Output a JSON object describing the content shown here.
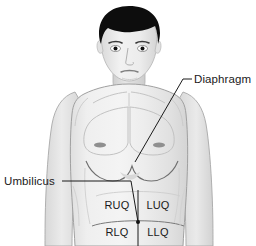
{
  "figure": {
    "background_color": "#ffffff"
  },
  "colors": {
    "skin_fill": "#ececec",
    "skin_shade": "#dcdcdc",
    "skin_shade_dark": "#cfcfcf",
    "outline": "#9a9a9a",
    "hair": "#101010",
    "label_text": "#1a1a1a",
    "leader_line": "#1a1a1a",
    "nipple": "#8c8c8c"
  },
  "labels": [
    {
      "id": "diaphragm",
      "text": "Diaphragm",
      "x": 194,
      "y": 83,
      "anchor": "start"
    },
    {
      "id": "umbilicus",
      "text": "Umbilicus",
      "x": 4,
      "y": 185,
      "anchor": "start"
    }
  ],
  "quadrants": [
    {
      "id": "ruq",
      "text": "RUQ",
      "x": 117,
      "y": 209,
      "full_name": "Right Upper Quadrant"
    },
    {
      "id": "luq",
      "text": "LUQ",
      "x": 152,
      "y": 209,
      "full_name": "Left Upper Quadrant"
    },
    {
      "id": "rlq",
      "text": "RLQ",
      "x": 117,
      "y": 236,
      "full_name": "Right Lower Quadrant"
    },
    {
      "id": "llq",
      "text": "LLQ",
      "x": 152,
      "y": 236,
      "full_name": "Left Lower Quadrant"
    }
  ],
  "leaders": {
    "diaphragm": {
      "label_dash": "M 183 79 L 192 79",
      "path": "M 183 79 L 135 162"
    },
    "umbilicus": {
      "path": "M 62 181 L 131 181 L 138 222"
    }
  },
  "quadrant_axes": {
    "vertical": "M 138 190 L 138 246",
    "umbilicus_point": {
      "x": 138,
      "y": 222
    }
  },
  "anatomy_parts": [
    {
      "id": "hair",
      "name": "hair"
    },
    {
      "id": "face",
      "name": "face"
    },
    {
      "id": "neck",
      "name": "neck"
    },
    {
      "id": "torso",
      "name": "torso"
    },
    {
      "id": "left-arm",
      "name": "left-arm"
    },
    {
      "id": "right-arm",
      "name": "right-arm"
    },
    {
      "id": "pectorals",
      "name": "pectoral-muscles"
    },
    {
      "id": "nipples",
      "name": "nipples"
    },
    {
      "id": "rib-cage",
      "name": "rib-cage-margin"
    },
    {
      "id": "abdomen",
      "name": "abdomen"
    }
  ]
}
